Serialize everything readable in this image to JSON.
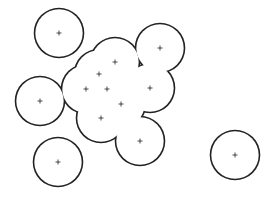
{
  "diagram": {
    "type": "point-clusters-with-buffer-outlines",
    "stroke_color": "#222222",
    "background_color": "#ffffff",
    "isolated_points": [
      {
        "x": 59,
        "y": 33
      },
      {
        "x": 40,
        "y": 101
      },
      {
        "x": 58,
        "y": 162
      },
      {
        "x": 235,
        "y": 155
      }
    ],
    "cluster_points": [
      {
        "x": 160,
        "y": 48
      },
      {
        "x": 115,
        "y": 62
      },
      {
        "x": 99,
        "y": 74
      },
      {
        "x": 86,
        "y": 89
      },
      {
        "x": 107,
        "y": 89
      },
      {
        "x": 150,
        "y": 88
      },
      {
        "x": 121,
        "y": 104
      },
      {
        "x": 101,
        "y": 118
      },
      {
        "x": 140,
        "y": 141
      }
    ]
  }
}
